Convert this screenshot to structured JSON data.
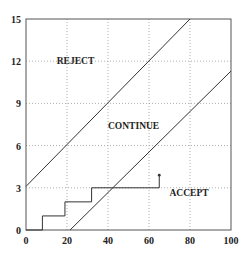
{
  "chart_data": {
    "type": "line",
    "title": "",
    "xlabel": "",
    "ylabel": "",
    "xlim": [
      0,
      100
    ],
    "ylim": [
      0,
      15
    ],
    "xticks": [
      0,
      20,
      40,
      60,
      80,
      100
    ],
    "yticks": [
      0,
      3,
      6,
      9,
      12,
      15
    ],
    "grid": true,
    "legend": null,
    "series": [
      {
        "name": "upper boundary",
        "x": [
          0,
          80
        ],
        "y": [
          3.1,
          15
        ]
      },
      {
        "name": "lower boundary",
        "x": [
          21.5,
          100
        ],
        "y": [
          0,
          11.3
        ]
      },
      {
        "name": "sample path",
        "step": true,
        "x": [
          0,
          8,
          8,
          19,
          19,
          32,
          32,
          65,
          65
        ],
        "y": [
          0,
          0,
          1,
          1,
          2,
          2,
          3,
          3,
          3.9
        ]
      }
    ],
    "annotations": [
      {
        "text": "REJECT",
        "x": 15,
        "y": 11.8
      },
      {
        "text": "CONTINUE",
        "x": 40,
        "y": 7.2
      },
      {
        "text": "ACCEPT",
        "x": 70,
        "y": 2.4
      }
    ]
  }
}
